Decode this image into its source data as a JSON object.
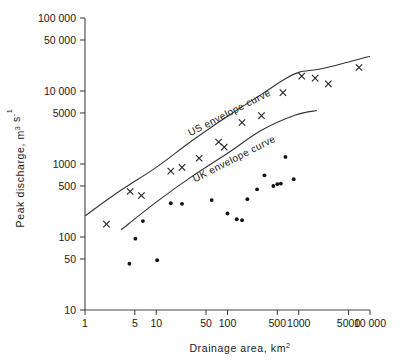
{
  "chart_data": {
    "type": "scatter",
    "title": "",
    "xlabel": "Drainage area, km²",
    "ylabel": "Peak discharge, m³ s⁻¹",
    "xscale": "log",
    "yscale": "log",
    "xlim": [
      1,
      10000
    ],
    "ylim": [
      10,
      100000
    ],
    "grid": false,
    "legend": "none",
    "xticks": [
      1,
      5,
      10,
      50,
      100,
      500,
      1000,
      5000,
      10000
    ],
    "xticklabels": [
      "1",
      "5",
      "10",
      "50",
      "100",
      "500",
      "1000",
      "5000",
      "10 000"
    ],
    "yticks": [
      10,
      50,
      100,
      500,
      1000,
      5000,
      10000,
      50000,
      100000
    ],
    "yticklabels": [
      "10",
      "50",
      "100",
      "500",
      "1000",
      "5000",
      "10 000",
      "50 000",
      "100 000"
    ],
    "annotations": [
      {
        "text": "US envelope curve",
        "x": 30,
        "y": 2400,
        "rotation": -27
      },
      {
        "text": "UK envelope curve",
        "x": 35,
        "y": 560,
        "rotation": -27
      }
    ],
    "series": [
      {
        "name": "US flood peaks",
        "marker": "x",
        "points": [
          [
            2.0,
            150
          ],
          [
            4.3,
            420
          ],
          [
            6.2,
            370
          ],
          [
            16,
            800
          ],
          [
            23,
            900
          ],
          [
            40,
            1200
          ],
          [
            75,
            2000
          ],
          [
            90,
            1700
          ],
          [
            160,
            3700
          ],
          [
            300,
            4600
          ],
          [
            600,
            9500
          ],
          [
            1100,
            16000
          ],
          [
            1700,
            15000
          ],
          [
            2600,
            12500
          ],
          [
            7000,
            21000
          ]
        ]
      },
      {
        "name": "UK flood peaks",
        "marker": "dot",
        "points": [
          [
            4.2,
            43
          ],
          [
            5.1,
            95
          ],
          [
            6.5,
            165
          ],
          [
            10.3,
            48
          ],
          [
            16,
            290
          ],
          [
            23,
            285
          ],
          [
            60,
            320
          ],
          [
            100,
            210
          ],
          [
            135,
            175
          ],
          [
            160,
            170
          ],
          [
            190,
            330
          ],
          [
            260,
            450
          ],
          [
            330,
            700
          ],
          [
            440,
            500
          ],
          [
            500,
            530
          ],
          [
            560,
            540
          ],
          [
            650,
            1250
          ],
          [
            850,
            620
          ]
        ]
      }
    ],
    "curves": [
      {
        "name": "US envelope curve",
        "points": [
          [
            1,
            195
          ],
          [
            3,
            420
          ],
          [
            10,
            900
          ],
          [
            30,
            2000
          ],
          [
            100,
            4500
          ],
          [
            300,
            9000
          ],
          [
            600,
            14000
          ],
          [
            1000,
            18000
          ],
          [
            2000,
            20000
          ],
          [
            5000,
            25000
          ],
          [
            10000,
            30000
          ]
        ]
      },
      {
        "name": "UK envelope curve",
        "points": [
          [
            3.2,
            125
          ],
          [
            10,
            300
          ],
          [
            30,
            650
          ],
          [
            100,
            1400
          ],
          [
            300,
            2900
          ],
          [
            900,
            4700
          ],
          [
            1800,
            5400
          ]
        ]
      }
    ]
  }
}
